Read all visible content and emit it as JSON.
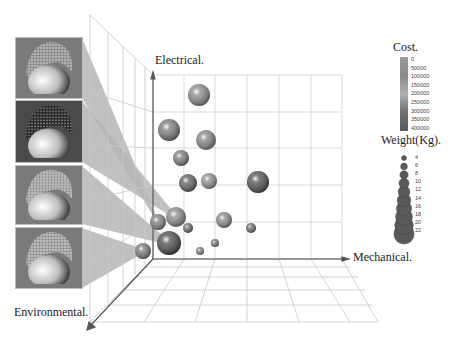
{
  "chart_data": {
    "type": "scatter",
    "subtype": "3d-bubble",
    "title": "",
    "axes": {
      "x": {
        "label": "Mechanical."
      },
      "y": {
        "label": "Electrical."
      },
      "z": {
        "label": "Environmental."
      }
    },
    "grid": true,
    "color_legend": {
      "title": "Cost.",
      "ticks": [
        "0",
        "50000",
        "100000",
        "150000",
        "200000",
        "250000",
        "300000",
        "350000",
        "400000"
      ],
      "range": [
        0,
        400000
      ]
    },
    "size_legend": {
      "title": "Weight(Kg).",
      "ticks": [
        "4",
        "6",
        "8",
        "10",
        "12",
        "14",
        "16",
        "18",
        "20",
        "22"
      ]
    },
    "points_screen": [
      {
        "cx": 199,
        "cy": 95,
        "r": 11,
        "shade": "#8a8a8a"
      },
      {
        "cx": 169,
        "cy": 130,
        "r": 11,
        "shade": "#7a7a7a"
      },
      {
        "cx": 206,
        "cy": 140,
        "r": 10,
        "shade": "#858585"
      },
      {
        "cx": 181,
        "cy": 158,
        "r": 8,
        "shade": "#7d7d7d"
      },
      {
        "cx": 188,
        "cy": 183,
        "r": 9,
        "shade": "#5f5f5f"
      },
      {
        "cx": 209,
        "cy": 181,
        "r": 8,
        "shade": "#8f8f8f"
      },
      {
        "cx": 258,
        "cy": 182,
        "r": 11,
        "shade": "#4f4f4f"
      },
      {
        "cx": 176,
        "cy": 217,
        "r": 10,
        "shade": "#8a8a8a"
      },
      {
        "cx": 158,
        "cy": 222,
        "r": 8,
        "shade": "#7f7f7f"
      },
      {
        "cx": 224,
        "cy": 220,
        "r": 8,
        "shade": "#8a8a8a"
      },
      {
        "cx": 188,
        "cy": 228,
        "r": 5,
        "shade": "#6a6a6a"
      },
      {
        "cx": 251,
        "cy": 228,
        "r": 5,
        "shade": "#6a6a6a"
      },
      {
        "cx": 169,
        "cy": 243,
        "r": 12,
        "shade": "#4a4a4a"
      },
      {
        "cx": 215,
        "cy": 243,
        "r": 4,
        "shade": "#777777"
      },
      {
        "cx": 200,
        "cy": 251,
        "r": 4,
        "shade": "#808080"
      },
      {
        "cx": 143,
        "cy": 251,
        "r": 8,
        "shade": "#7a7a7a"
      }
    ],
    "callouts": [
      {
        "thumb": 1,
        "target_point": 8
      },
      {
        "thumb": 2,
        "target_point": 7
      },
      {
        "thumb": 3,
        "target_point": 12
      },
      {
        "thumb": 4,
        "target_point": 15
      }
    ]
  },
  "labels": {
    "electrical": "Electrical.",
    "mechanical": "Mechanical.",
    "environmental": "Environmental.",
    "cost_title": "Cost.",
    "weight_title": "Weight(Kg)."
  },
  "thumbnails": [
    {
      "name": "design-thumbnail-1",
      "y": 38,
      "h": 60,
      "dark": false,
      "hair": "#9a9a9a"
    },
    {
      "name": "design-thumbnail-2",
      "y": 101,
      "h": 61,
      "dark": true,
      "hair": "#2e2e2e"
    },
    {
      "name": "design-thumbnail-3",
      "y": 166,
      "h": 58,
      "dark": false,
      "hair": "#a8a8a8"
    },
    {
      "name": "design-thumbnail-4",
      "y": 228,
      "h": 60,
      "dark": false,
      "hair": "#a5a5a5"
    }
  ]
}
